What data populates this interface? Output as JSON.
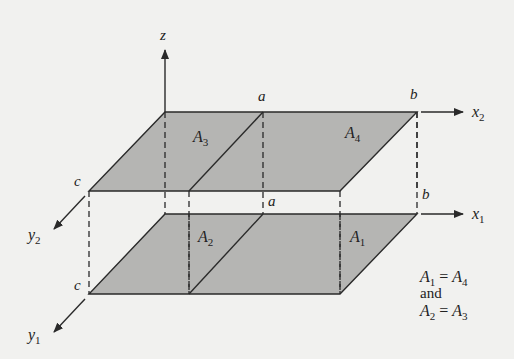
{
  "figure": {
    "axes": {
      "z": "z",
      "x2": "x",
      "x2_sub": "2",
      "x1": "x",
      "x1_sub": "1",
      "y2": "y",
      "y2_sub": "2",
      "y1": "y",
      "y1_sub": "1"
    },
    "points": {
      "a_top": "a",
      "b_top": "b",
      "a_bottom": "a",
      "b_bottom": "b",
      "c_top": "c",
      "c_bottom": "c"
    },
    "areas": {
      "A3": {
        "base": "A",
        "sub": "3"
      },
      "A4": {
        "base": "A",
        "sub": "4"
      },
      "A2": {
        "base": "A",
        "sub": "2"
      },
      "A1": {
        "base": "A",
        "sub": "1"
      }
    },
    "note": {
      "line1": {
        "l_base": "A",
        "l_sub": "1",
        "eq": "=",
        "r_base": "A",
        "r_sub": "4"
      },
      "line2": "and",
      "line3": {
        "l_base": "A",
        "l_sub": "2",
        "eq": "=",
        "r_base": "A",
        "r_sub": "3"
      }
    },
    "colors": {
      "background": "#f1f1ef",
      "shade": "#b5b5b3",
      "line": "#2a2a2a"
    }
  }
}
